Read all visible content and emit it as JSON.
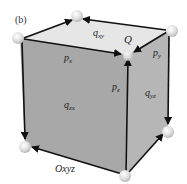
{
  "figure": {
    "panel_label": "(b)",
    "labels": {
      "q_xy": {
        "base": "q",
        "sub": "xy"
      },
      "Q": {
        "base": "Q"
      },
      "p_x": {
        "base": "p",
        "sub": "x"
      },
      "p_y": {
        "base": "p",
        "sub": "y"
      },
      "p_z": {
        "base": "p",
        "sub": "z"
      },
      "q_zx": {
        "base": "q",
        "sub": "zx"
      },
      "q_yz": {
        "base": "q",
        "sub": "yz"
      },
      "origin": {
        "base": "Oxyz"
      }
    },
    "colors": {
      "front_face": "#a9a9a9",
      "right_face": "#b4b4b4",
      "top_face": "#e4e4e4",
      "edge": "#111111",
      "node": "#dcdcdc"
    }
  }
}
